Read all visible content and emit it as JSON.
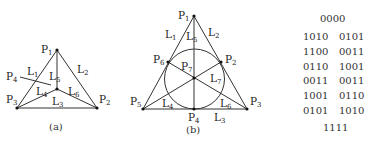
{
  "figure_a": {
    "caption": "(a)",
    "points": [
      {
        "id": "P1",
        "label": "P",
        "sub": "1"
      },
      {
        "id": "P2",
        "label": "P",
        "sub": "2"
      },
      {
        "id": "P3",
        "label": "P",
        "sub": "3"
      },
      {
        "id": "P4",
        "label": "P",
        "sub": "4"
      }
    ],
    "lines": [
      {
        "id": "L1",
        "label": "L",
        "sub": "1"
      },
      {
        "id": "L2",
        "label": "L",
        "sub": "2"
      },
      {
        "id": "L3",
        "label": "L",
        "sub": "3"
      },
      {
        "id": "L4",
        "label": "L",
        "sub": "4"
      },
      {
        "id": "L5",
        "label": "L",
        "sub": "5"
      },
      {
        "id": "L6",
        "label": "L",
        "sub": "6"
      }
    ]
  },
  "figure_b": {
    "caption": "(b)",
    "points": [
      {
        "id": "P1",
        "label": "P",
        "sub": "1"
      },
      {
        "id": "P2",
        "label": "P",
        "sub": "2"
      },
      {
        "id": "P3",
        "label": "P",
        "sub": "3"
      },
      {
        "id": "P4",
        "label": "P",
        "sub": "4"
      },
      {
        "id": "P5",
        "label": "P",
        "sub": "5"
      },
      {
        "id": "P6",
        "label": "P",
        "sub": "6"
      },
      {
        "id": "P7",
        "label": "P",
        "sub": "7"
      }
    ],
    "lines": [
      {
        "id": "L1",
        "label": "L",
        "sub": "1"
      },
      {
        "id": "L2",
        "label": "L",
        "sub": "2"
      },
      {
        "id": "L3",
        "label": "L",
        "sub": "3"
      },
      {
        "id": "L4",
        "label": "L",
        "sub": "4"
      },
      {
        "id": "L5",
        "label": "L",
        "sub": "5"
      },
      {
        "id": "L6",
        "label": "L",
        "sub": "6"
      },
      {
        "id": "L7",
        "label": "L",
        "sub": "7"
      }
    ]
  },
  "codewords": {
    "top": "0000",
    "rows": [
      [
        "1010",
        "0101"
      ],
      [
        "1100",
        "0011"
      ],
      [
        "0110",
        "1001"
      ],
      [
        "0011",
        "0011"
      ],
      [
        "1001",
        "0110"
      ],
      [
        "0101",
        "1010"
      ]
    ],
    "bottom": "1111"
  }
}
